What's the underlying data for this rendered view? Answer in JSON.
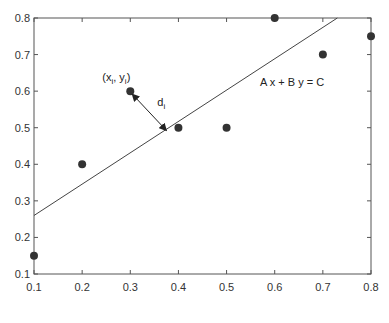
{
  "chart_data": {
    "type": "scatter",
    "title": "",
    "xlabel": "",
    "ylabel": "",
    "xlim": [
      0.1,
      0.8
    ],
    "ylim": [
      0.1,
      0.8
    ],
    "grid": false,
    "xticks": [
      "0.1",
      "0.2",
      "0.3",
      "0.4",
      "0.5",
      "0.6",
      "0.7",
      "0.8"
    ],
    "yticks": [
      "0.1",
      "0.2",
      "0.3",
      "0.4",
      "0.5",
      "0.6",
      "0.7",
      "0.8"
    ],
    "series": [
      {
        "name": "points",
        "x": [
          0.1,
          0.2,
          0.3,
          0.4,
          0.5,
          0.6,
          0.7,
          0.8
        ],
        "y": [
          0.15,
          0.4,
          0.6,
          0.5,
          0.5,
          0.8,
          0.7,
          0.75
        ]
      }
    ],
    "fit_line": {
      "label": "A x + B y = C",
      "x": [
        0.1,
        0.73
      ],
      "y": [
        0.26,
        0.8
      ]
    },
    "annotations": {
      "point_label": {
        "text_prefix": "(x",
        "sub1": "i",
        "mid": ", y",
        "sub2": "i",
        "suffix": ")",
        "x": 0.3,
        "y": 0.6
      },
      "distance_label": {
        "text": "d",
        "sub": "i"
      },
      "distance_arrow": {
        "from": [
          0.3,
          0.6
        ],
        "to": [
          0.375,
          0.4925
        ]
      }
    },
    "colors": {
      "marker": "#333333",
      "line": "#444444",
      "axes": "#555555"
    }
  }
}
